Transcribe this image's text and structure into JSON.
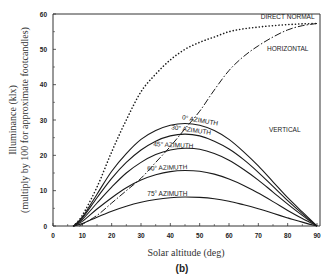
{
  "chart_data": {
    "type": "line",
    "title": "",
    "caption": "(b)",
    "xlabel": "Solar altitude (deg)",
    "ylabel_line1": "Illuminance (klx)",
    "ylabel_line2": "(multiply by 100 for approximate footcandles)",
    "xlim": [
      0,
      90
    ],
    "ylim": [
      0,
      60
    ],
    "x_ticks": [
      0,
      10,
      20,
      30,
      40,
      50,
      60,
      70,
      80,
      90
    ],
    "y_ticks": [
      0,
      10,
      20,
      30,
      40,
      50,
      60
    ],
    "grid": false,
    "series": [
      {
        "name": "DIRECT NORMAL",
        "style": "dotted",
        "x": [
          7,
          10,
          15,
          20,
          25,
          30,
          35,
          40,
          45,
          50,
          55,
          60,
          65,
          70,
          75,
          80,
          85,
          90
        ],
        "y": [
          0,
          3,
          11,
          21,
          30,
          38,
          43,
          47,
          50,
          52,
          53.5,
          55,
          55.8,
          56.3,
          56.7,
          57,
          57.2,
          57.3
        ]
      },
      {
        "name": "HORIZONTAL",
        "style": "dashed",
        "x": [
          9,
          15,
          20,
          25,
          30,
          35,
          40,
          45,
          50,
          55,
          60,
          65,
          70,
          75,
          80,
          85,
          90
        ],
        "y": [
          0,
          3,
          6.5,
          10,
          13.5,
          18,
          22.5,
          27.5,
          32.5,
          38.5,
          44,
          48,
          51,
          53.5,
          55.5,
          56.7,
          57.3
        ]
      },
      {
        "name": "0° AZIMUTH",
        "style": "solid",
        "x": [
          7,
          10,
          15,
          20,
          25,
          30,
          35,
          40,
          45,
          50,
          55,
          60,
          65,
          70,
          75,
          80,
          85,
          90
        ],
        "y": [
          0,
          2.5,
          9,
          15.5,
          20.5,
          24.5,
          27,
          28.5,
          29,
          28.5,
          27,
          24.5,
          21,
          17,
          12.5,
          8,
          4,
          0
        ]
      },
      {
        "name": "30° AZIMUTH",
        "style": "solid",
        "x": [
          7,
          10,
          15,
          20,
          25,
          30,
          35,
          40,
          45,
          50,
          55,
          60,
          65,
          70,
          75,
          80,
          85,
          90
        ],
        "y": [
          0,
          2.2,
          8,
          13.5,
          18,
          21.5,
          24,
          25.5,
          26,
          25.5,
          24,
          21.8,
          18.8,
          15.2,
          11.2,
          7.2,
          3.5,
          0
        ]
      },
      {
        "name": "45° AZIMUTH",
        "style": "solid",
        "x": [
          7,
          10,
          15,
          20,
          25,
          30,
          35,
          40,
          45,
          50,
          55,
          60,
          65,
          70,
          75,
          80,
          85,
          90
        ],
        "y": [
          0,
          1.8,
          6.5,
          11,
          15,
          18,
          20.2,
          21.5,
          22,
          21.7,
          20.5,
          18.6,
          16,
          13,
          9.6,
          6.2,
          3,
          0
        ]
      },
      {
        "name": "60° AZIMUTH",
        "style": "solid",
        "x": [
          7,
          10,
          15,
          20,
          25,
          30,
          35,
          40,
          45,
          50,
          55,
          60,
          65,
          70,
          75,
          80,
          85,
          90
        ],
        "y": [
          0,
          1.3,
          4.8,
          8,
          10.8,
          13,
          14.5,
          15.4,
          15.7,
          15.5,
          14.7,
          13.3,
          11.5,
          9.3,
          6.9,
          4.4,
          2.1,
          0
        ]
      },
      {
        "name": "75° AZIMUTH",
        "style": "solid",
        "x": [
          7,
          10,
          15,
          20,
          25,
          30,
          35,
          40,
          45,
          50,
          55,
          60,
          65,
          70,
          75,
          80,
          85,
          90
        ],
        "y": [
          0,
          0.7,
          2.5,
          4.2,
          5.6,
          6.7,
          7.5,
          8,
          8.2,
          8.1,
          7.7,
          7,
          6,
          4.9,
          3.6,
          2.3,
          1.1,
          0
        ]
      }
    ],
    "annotations": [
      {
        "text": "DIRECT NORMAL",
        "x": 80,
        "y": 58.5
      },
      {
        "text": "HORIZONTAL",
        "x": 80,
        "y": 49.5
      },
      {
        "text": "VERTICAL",
        "x": 79,
        "y": 26.5
      },
      {
        "text": "0° AZIMUTH",
        "x": 50,
        "y": 29.3,
        "rotate": 10
      },
      {
        "text": "30° AZIMUTH",
        "x": 47,
        "y": 26.6,
        "rotate": 8
      },
      {
        "text": "45° AZIMUTH",
        "x": 41,
        "y": 22.3,
        "rotate": 3
      },
      {
        "text": "60° AZIMUTH",
        "x": 39,
        "y": 15.9,
        "rotate": -2
      },
      {
        "text": "75° AZIMUTH",
        "x": 39,
        "y": 8.4,
        "rotate": 0
      }
    ]
  }
}
